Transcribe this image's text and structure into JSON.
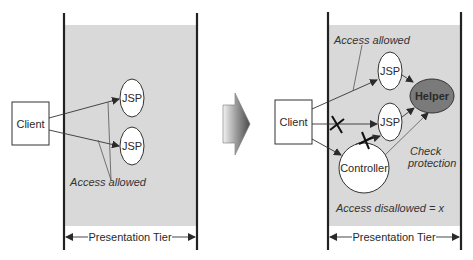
{
  "diagram": {
    "before": {
      "client_label": "Client",
      "jsp_top_label": "JSP",
      "jsp_bottom_label": "JSP",
      "annotation": "Access allowed",
      "tier_label": "Presentation Tier"
    },
    "after": {
      "client_label": "Client",
      "jsp_top_label": "JSP",
      "jsp_bottom_label": "JSP",
      "helper_label": "Helper",
      "controller_label": "Controller",
      "annotation_allowed": "Access allowed",
      "annotation_check_line1": "Check",
      "annotation_check_line2": "protection",
      "annotation_disallowed": "Access disallowed = x",
      "tier_label": "Presentation Tier"
    },
    "colors": {
      "tier_fill": "#d9d9d9",
      "helper_fill": "#7a7a7a",
      "line": "#2a2a2a"
    }
  }
}
